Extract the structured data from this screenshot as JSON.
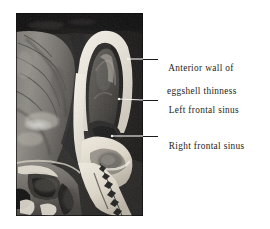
{
  "figure": {
    "type": "anatomical-photograph",
    "background_color": "#ffffff",
    "photo": {
      "description": "Black and white cadaveric sagittal section photograph of the frontal region of the skull, showing the left and right frontal sinuses separated by a bright bony septum, with the thin anterior wall arching over the sinus cavities.",
      "x": 16,
      "y": 13,
      "width": 127,
      "height": 203,
      "tone_dark": "#1d1d1d",
      "tone_mid": "#8a8a8a",
      "tone_bright": "#f0ece4"
    },
    "labels": [
      {
        "id": "anterior-wall",
        "line1": "Anterior wall of",
        "line2": "eggshell thinness",
        "text_x": 159,
        "text_y": 52,
        "leader": {
          "x1": 128,
          "y1": 59,
          "x2": 157,
          "y2": 59
        }
      },
      {
        "id": "left-frontal-sinus",
        "line1": "Left frontal sinus",
        "line2": "",
        "text_x": 159,
        "text_y": 94,
        "leader": {
          "x1": 119,
          "y1": 99,
          "x2": 157,
          "y2": 100
        }
      },
      {
        "id": "right-frontal-sinus",
        "line1": "Right frontal sinus",
        "line2": "",
        "text_x": 159,
        "text_y": 130,
        "leader": {
          "x1": 112,
          "y1": 136,
          "x2": 157,
          "y2": 136
        }
      }
    ],
    "leader_color": "#1a1a1a",
    "text_color": "#1c1c1c"
  }
}
